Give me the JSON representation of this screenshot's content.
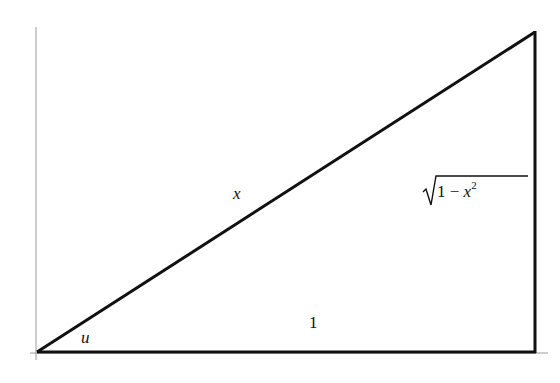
{
  "figure": {
    "type": "right-triangle",
    "colors": {
      "stroke": "#111111",
      "axis": "#9a9a9a",
      "background": "#ffffff"
    },
    "vertices": {
      "origin": [
        37,
        352
      ],
      "right_angle": [
        535,
        352
      ],
      "apex": [
        535,
        32
      ]
    }
  },
  "labels": {
    "hypotenuse": "x",
    "adjacent": "1",
    "opposite": {
      "radical": "√",
      "radicand_prefix": "1 − ",
      "variable": "x",
      "exponent": "2"
    },
    "angle": "u"
  }
}
